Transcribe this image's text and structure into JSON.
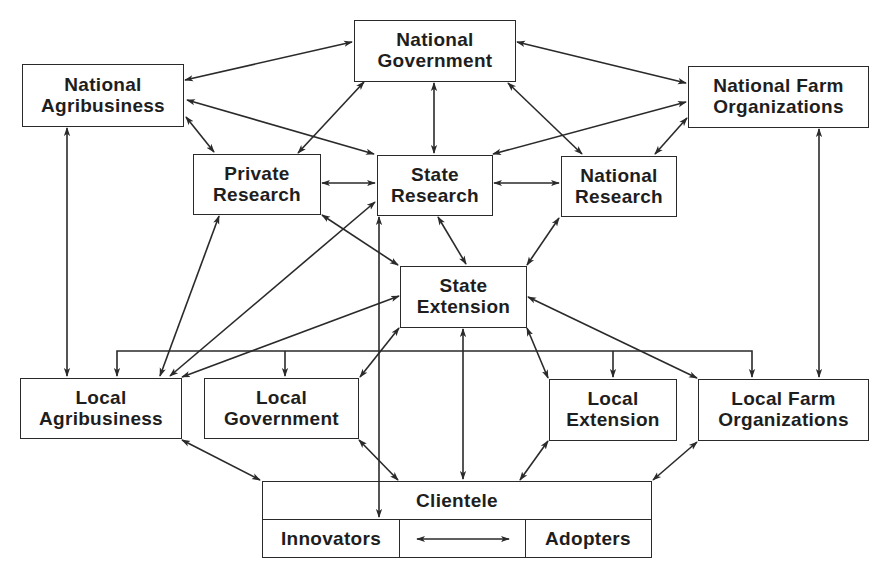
{
  "diagram": {
    "type": "relationship-network",
    "nodes": {
      "national_government": {
        "line1": "National",
        "line2": "Government"
      },
      "national_agribusiness": {
        "line1": "National",
        "line2": "Agribusiness"
      },
      "national_farm_organizations": {
        "line1": "National Farm",
        "line2": "Organizations"
      },
      "private_research": {
        "line1": "Private",
        "line2": "Research"
      },
      "state_research": {
        "line1": "State",
        "line2": "Research"
      },
      "national_research": {
        "line1": "National",
        "line2": "Research"
      },
      "state_extension": {
        "line1": "State",
        "line2": "Extension"
      },
      "local_agribusiness": {
        "line1": "Local",
        "line2": "Agribusiness"
      },
      "local_government": {
        "line1": "Local",
        "line2": "Government"
      },
      "local_extension": {
        "line1": "Local",
        "line2": "Extension"
      },
      "local_farm_organizations": {
        "line1": "Local Farm",
        "line2": "Organizations"
      },
      "clientele": {
        "title": "Clientele",
        "left": "Innovators",
        "right": "Adopters"
      }
    },
    "edges": [
      {
        "from": "National Agribusiness",
        "to": "National Government",
        "arrows": "both"
      },
      {
        "from": "National Government",
        "to": "National Farm Organizations",
        "arrows": "both"
      },
      {
        "from": "National Government",
        "to": "State Research",
        "arrows": "both"
      },
      {
        "from": "National Government",
        "to": "Private Research",
        "arrows": "both"
      },
      {
        "from": "National Government",
        "to": "National Research",
        "arrows": "both"
      },
      {
        "from": "National Agribusiness",
        "to": "Private Research",
        "arrows": "both"
      },
      {
        "from": "National Agribusiness",
        "to": "State Research",
        "arrows": "both"
      },
      {
        "from": "National Farm Organizations",
        "to": "State Research",
        "arrows": "both"
      },
      {
        "from": "National Farm Organizations",
        "to": "National Research",
        "arrows": "both"
      },
      {
        "from": "Private Research",
        "to": "State Research",
        "arrows": "both"
      },
      {
        "from": "State Research",
        "to": "National Research",
        "arrows": "both"
      },
      {
        "from": "Private Research",
        "to": "State Extension",
        "arrows": "both"
      },
      {
        "from": "State Research",
        "to": "State Extension",
        "arrows": "both"
      },
      {
        "from": "National Research",
        "to": "State Extension",
        "arrows": "both"
      },
      {
        "from": "National Agribusiness",
        "to": "Local Agribusiness",
        "arrows": "both"
      },
      {
        "from": "National Farm Organizations",
        "to": "Local Farm Organizations",
        "arrows": "both"
      },
      {
        "from": "Private Research",
        "to": "Local Agribusiness",
        "arrows": "both"
      },
      {
        "from": "State Research",
        "to": "Local Agribusiness",
        "arrows": "both"
      },
      {
        "from": "State Extension",
        "to": "Local Agribusiness",
        "arrows": "both"
      },
      {
        "from": "State Extension",
        "to": "Local Government",
        "arrows": "both"
      },
      {
        "from": "State Extension",
        "to": "Local Extension",
        "arrows": "both"
      },
      {
        "from": "State Extension",
        "to": "Local Farm Organizations",
        "arrows": "both"
      },
      {
        "from": "State Extension",
        "to": "Clientele",
        "arrows": "both"
      },
      {
        "from": "State Research",
        "to": "Innovators",
        "arrows": "both"
      },
      {
        "from": "Local Agribusiness",
        "to": "Clientele",
        "arrows": "both"
      },
      {
        "from": "Local Government",
        "to": "Clientele",
        "arrows": "both"
      },
      {
        "from": "Local Extension",
        "to": "Clientele",
        "arrows": "both"
      },
      {
        "from": "Local Farm Organizations",
        "to": "Clientele",
        "arrows": "both"
      },
      {
        "from": "Innovators",
        "to": "Adopters",
        "arrows": "both"
      },
      {
        "from": "Horizontal bus",
        "to": [
          "Local Agribusiness",
          "Local Government",
          "Local Extension",
          "Local Farm Organizations"
        ],
        "arrows": "down"
      }
    ]
  }
}
